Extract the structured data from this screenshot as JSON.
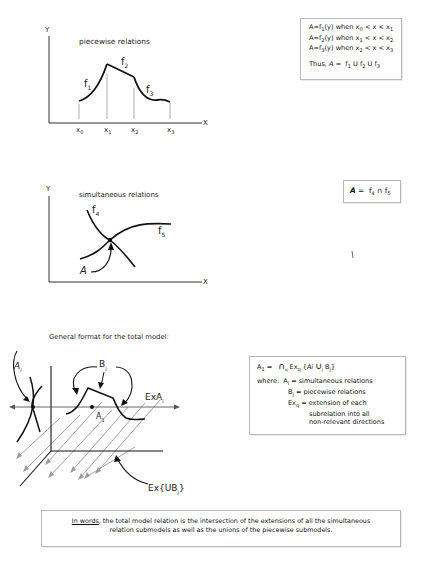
{
  "diagram1": {
    "title": "piecewise relations",
    "y_axis": "Y",
    "x_axis": "X",
    "curves": [
      "f1",
      "f2",
      "f3"
    ],
    "x_ticks": [
      "x0",
      "x1",
      "x2",
      "x3"
    ],
    "box_lines": [
      "A=f1(y) when x0 < x < x1",
      "A=f2(y) when x1 < x < x2",
      "A=f3(y) when x2 < x < x3"
    ],
    "box_conclusion": "Thus, A = f1 U f2 U f3"
  },
  "diagram2": {
    "title": "simultaneous relations",
    "y_axis": "Y",
    "x_axis": "X",
    "curves": [
      "f4",
      "f5"
    ],
    "point_label": "A",
    "box_formula": "A = f4 ∩ f5"
  },
  "diagram3": {
    "heading": "General format for the total model:",
    "labels": {
      "ai": "Ai",
      "bj": "Bj",
      "exai": "ExAi",
      "a1": "A1",
      "exubj": "Ex{UBj}"
    },
    "box": {
      "formula": "A1 = ∩q Exq {Ai ∪j Bj}",
      "where_label": "where:",
      "definitions": [
        "Ai = simultaneous relations",
        "Bj = piecewise relations",
        "Exq = extension of each",
        "subrelation into all",
        "non-relevant directions"
      ]
    }
  },
  "summary": {
    "lead": "In words",
    "text_line1": ", the total model relation is the intersection of the extensions of all the simultaneous",
    "text_line2": "relation submodels as well as the unions of the piecewise submodels."
  }
}
